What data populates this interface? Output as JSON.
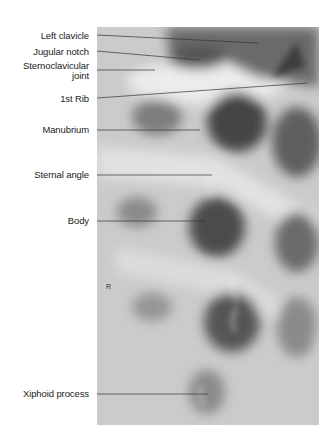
{
  "figure": {
    "type": "radiograph",
    "side_marker": "R"
  },
  "labels": [
    {
      "id": "left-clavicle",
      "text": "Left clavicle",
      "y": 36
    },
    {
      "id": "jugular-notch",
      "text": "Jugular notch",
      "y": 52
    },
    {
      "id": "sternoclavicular-joint-1",
      "text": "Sternoclavicular",
      "y": 65
    },
    {
      "id": "sternoclavicular-joint-2",
      "text": "joint",
      "y": 75
    },
    {
      "id": "first-rib",
      "text": "1st Rib",
      "y": 95
    },
    {
      "id": "manubrium",
      "text": "Manubrium",
      "y": 127
    },
    {
      "id": "sternal-angle",
      "text": "Sternal angle",
      "y": 173
    },
    {
      "id": "body",
      "text": "Body",
      "y": 219
    },
    {
      "id": "xiphoid-process",
      "text": "Xiphoid process",
      "y": 392
    }
  ]
}
